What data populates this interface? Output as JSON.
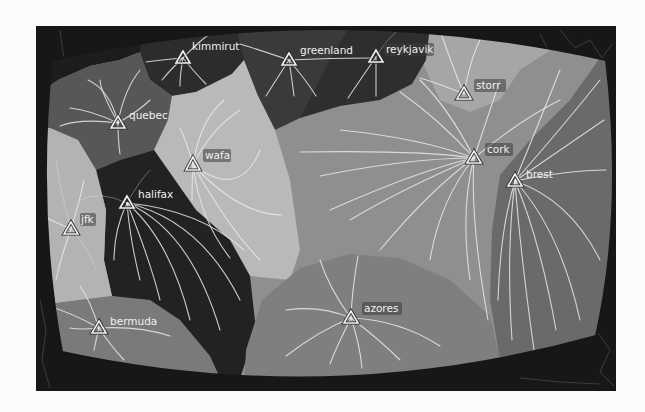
{
  "map": {
    "title": "",
    "colors": {
      "background": "#fbfbfb",
      "frame": "#171717",
      "flow_lines": "#e9e9e9",
      "station_marker": "#f2f2f2",
      "label_text": "#f0f0f0"
    },
    "stations": [
      {
        "id": "kimmirut",
        "label": "kimmirut",
        "x": 183,
        "y": 58
      },
      {
        "id": "greenland",
        "label": "greenland",
        "x": 289,
        "y": 60
      },
      {
        "id": "reykjavik",
        "label": "reykjavik",
        "x": 376,
        "y": 57
      },
      {
        "id": "storr",
        "label": "storr",
        "x": 464,
        "y": 94
      },
      {
        "id": "quebec",
        "label": "quebec",
        "x": 118,
        "y": 123
      },
      {
        "id": "wafa",
        "label": "wafa",
        "x": 193,
        "y": 165
      },
      {
        "id": "cork",
        "label": "cork",
        "x": 474,
        "y": 158
      },
      {
        "id": "brest",
        "label": "brest",
        "x": 515,
        "y": 181
      },
      {
        "id": "halifax",
        "label": "halifax",
        "x": 127,
        "y": 203
      },
      {
        "id": "jfk",
        "label": "jfk",
        "x": 71,
        "y": 229
      },
      {
        "id": "azores",
        "label": "azores",
        "x": 351,
        "y": 318
      },
      {
        "id": "bermuda",
        "label": "bermuda",
        "x": 99,
        "y": 328
      }
    ],
    "regions": [
      {
        "station": "kimmirut",
        "shade": "#2c2c2c"
      },
      {
        "station": "greenland",
        "shade": "#3a3a3a"
      },
      {
        "station": "reykjavik",
        "shade": "#2e2e2e"
      },
      {
        "station": "storr",
        "shade": "#a6a6a6"
      },
      {
        "station": "quebec",
        "shade": "#575757"
      },
      {
        "station": "wafa",
        "shade": "#b9b9b9"
      },
      {
        "station": "cork",
        "shade": "#8f8f8f"
      },
      {
        "station": "brest",
        "shade": "#6a6a6a"
      },
      {
        "station": "halifax",
        "shade": "#222222"
      },
      {
        "station": "jfk",
        "shade": "#b3b3b3"
      },
      {
        "station": "azores",
        "shade": "#7f7f7f"
      },
      {
        "station": "bermuda",
        "shade": "#7a7a7a"
      }
    ]
  }
}
